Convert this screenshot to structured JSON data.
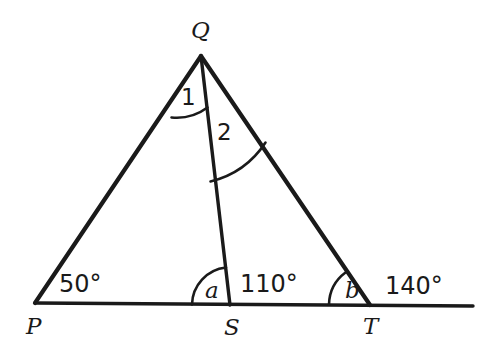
{
  "figure": {
    "background_color": "#ffffff",
    "stroke_color": "#1a1a1a",
    "width": 499,
    "height": 351
  },
  "points": {
    "P": {
      "label": "P",
      "x": 35,
      "y": 303,
      "label_x": 26,
      "label_y": 334
    },
    "Q": {
      "label": "Q",
      "x": 201,
      "y": 56,
      "label_x": 191,
      "label_y": 38
    },
    "S": {
      "label": "S",
      "x": 230,
      "y": 305,
      "label_x": 224,
      "label_y": 335
    },
    "T": {
      "label": "T",
      "x": 370,
      "y": 305,
      "label_x": 363,
      "label_y": 334
    },
    "E": {
      "label": "",
      "x": 473,
      "y": 306
    }
  },
  "segments": [
    {
      "name": "side-pq",
      "from": "P",
      "to": "Q",
      "kind": "side"
    },
    {
      "name": "side-qt",
      "from": "Q",
      "to": "T",
      "kind": "side"
    },
    {
      "name": "cevian-qs",
      "from": "Q",
      "to": "S",
      "kind": "cevian"
    },
    {
      "name": "base-pe",
      "from": "P",
      "to": "E",
      "kind": "base"
    }
  ],
  "angles": [
    {
      "name": "angle-1-at-q",
      "label": "1",
      "label_type": "number",
      "vertex": "Q",
      "label_x": 181,
      "label_y": 105,
      "arc": "M 171.5 117.5 A 52 52 0 0 0 207.5 107.5"
    },
    {
      "name": "angle-2-at-q",
      "label": "2",
      "label_type": "number",
      "vertex": "Q",
      "label_x": 217,
      "label_y": 140,
      "arc": "M 210.5 181.5 A 92 92 0 0 0 265.5 142.5"
    },
    {
      "name": "angle-a-at-s",
      "label": "a",
      "label_type": "variable",
      "vertex": "S",
      "label_x": 205,
      "label_y": 298,
      "arc": "M 192 304.5 A 38 38 0 0 1 226 267.5"
    },
    {
      "name": "angle-b-at-t",
      "label": "b",
      "label_type": "variable",
      "vertex": "T",
      "label_x": 345,
      "label_y": 298,
      "arc": "M 329 304.5 A 41 41 0 0 1 345.5 272.5"
    }
  ],
  "measures": [
    {
      "name": "measure-50-at-p",
      "label": "50°",
      "x": 59,
      "y": 292
    },
    {
      "name": "measure-110-at-s",
      "label": "110°",
      "x": 240,
      "y": 292
    },
    {
      "name": "measure-140-at-t",
      "label": "140°",
      "x": 385,
      "y": 294
    }
  ]
}
